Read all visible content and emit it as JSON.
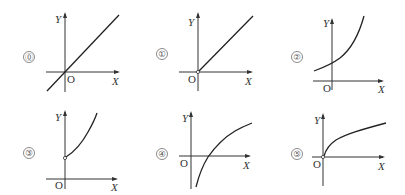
{
  "figure": {
    "colors": {
      "axis": "#333333",
      "curve": "#222222",
      "label": "#555555",
      "background": "#ffffff"
    },
    "panels": [
      {
        "id": "0",
        "label": "⓪",
        "y_label": "Y",
        "x_label": "X",
        "origin_label": "O",
        "curve": "straight line through origin extending into third quadrant",
        "open_point_at_origin": false
      },
      {
        "id": "1",
        "label": "①",
        "y_label": "Y",
        "x_label": "X",
        "origin_label": "O",
        "curve": "ray from origin (open circle) into first quadrant",
        "open_point_at_origin": true
      },
      {
        "id": "2",
        "label": "②",
        "y_label": "Y",
        "x_label": "X",
        "origin_label": "O",
        "curve": "increasing convex curve with positive y-intercept, defined for negative x too",
        "open_point_at_origin": false
      },
      {
        "id": "3",
        "label": "③",
        "y_label": "Y",
        "x_label": "X",
        "origin_label": "O",
        "curve": "increasing convex curve starting at open point on positive Y axis",
        "open_point_on_y_axis": true
      },
      {
        "id": "4",
        "label": "④",
        "y_label": "Y",
        "x_label": "X",
        "origin_label": "O",
        "curve": "increasing concave curve crossing X axis at positive x, going down near Y axis",
        "open_point_at_origin": false
      },
      {
        "id": "5",
        "label": "⑤",
        "y_label": "Y",
        "x_label": "X",
        "origin_label": "O",
        "curve": "increasing concave curve starting from origin (open circle)",
        "open_point_at_origin": true
      }
    ]
  }
}
